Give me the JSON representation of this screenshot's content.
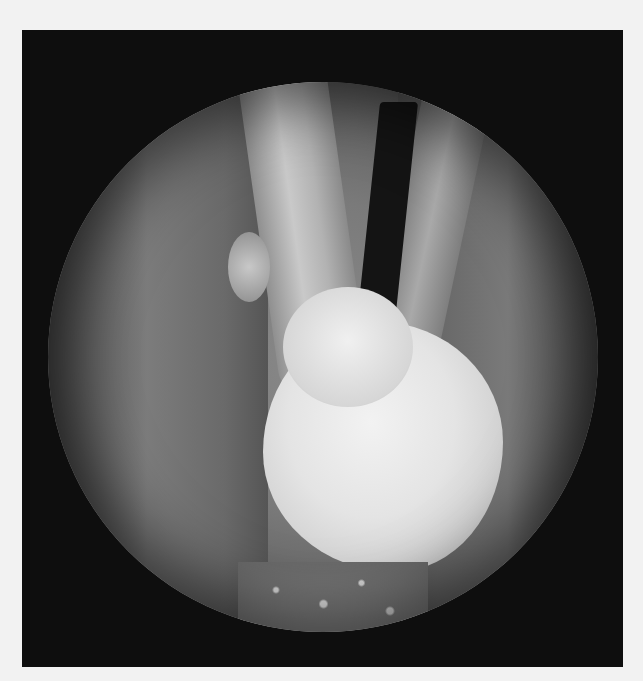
{
  "image": {
    "kind": "endoscopic-photograph",
    "color_mode": "grayscale",
    "colors": {
      "page_background": "#f2f2f2",
      "frame_background": "#0e0e0e",
      "tissue_mid": "#7a7a7a",
      "lesion": "#e8e8e8",
      "airway_lumen": "#141414"
    },
    "regions": [
      {
        "name": "circular-scope-view"
      },
      {
        "name": "lesion-mass"
      },
      {
        "name": "vocal-fold-left"
      },
      {
        "name": "vocal-fold-right"
      },
      {
        "name": "airway-lumen"
      }
    ]
  }
}
